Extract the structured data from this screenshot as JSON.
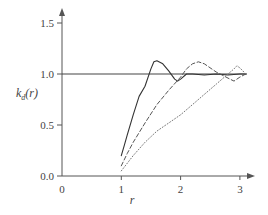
{
  "chart_data": {
    "type": "line",
    "title": "",
    "xlabel": "r",
    "ylabel": "k_d(r)",
    "ylabel_main": "k",
    "ylabel_sub": "d",
    "ylabel_arg": "(r)",
    "xlim": [
      0,
      3.2
    ],
    "ylim": [
      0,
      1.65
    ],
    "x_ticks": [
      0,
      1,
      2,
      3
    ],
    "x_tick_labels": [
      "0",
      "1",
      "2",
      "3"
    ],
    "y_ticks": [
      0.0,
      0.5,
      1.0,
      1.5
    ],
    "y_tick_labels": [
      "0.0",
      "0.5",
      "1.0",
      "1.5"
    ],
    "grid": false,
    "legend": null,
    "reference_line": {
      "y": 1.0,
      "x_from": 0,
      "x_to": 3.2,
      "style": "solid"
    },
    "series": [
      {
        "name": "solid",
        "style": "solid",
        "x": [
          1.0,
          1.05,
          1.1,
          1.2,
          1.3,
          1.4,
          1.5,
          1.55,
          1.6,
          1.7,
          1.8,
          1.9,
          1.95,
          2.0,
          2.1,
          2.2,
          2.4,
          2.6,
          2.8,
          3.0,
          3.1
        ],
        "y": [
          0.2,
          0.3,
          0.4,
          0.6,
          0.78,
          0.88,
          1.05,
          1.12,
          1.13,
          1.1,
          1.03,
          0.95,
          0.93,
          0.95,
          1.0,
          1.0,
          0.99,
          1.0,
          0.99,
          1.0,
          1.0
        ]
      },
      {
        "name": "dashed",
        "style": "dashed",
        "x": [
          1.0,
          1.1,
          1.2,
          1.4,
          1.6,
          1.8,
          2.0,
          2.1,
          2.2,
          2.3,
          2.4,
          2.6,
          2.8,
          2.9,
          3.0,
          3.1
        ],
        "y": [
          0.1,
          0.22,
          0.33,
          0.52,
          0.7,
          0.84,
          0.97,
          1.05,
          1.1,
          1.12,
          1.1,
          1.02,
          0.96,
          0.93,
          0.97,
          1.0
        ]
      },
      {
        "name": "dotted",
        "style": "dotted",
        "x": [
          1.0,
          1.2,
          1.4,
          1.6,
          1.8,
          2.0,
          2.2,
          2.4,
          2.6,
          2.8,
          2.9,
          2.95,
          3.0,
          3.1
        ],
        "y": [
          0.05,
          0.2,
          0.33,
          0.44,
          0.52,
          0.6,
          0.7,
          0.8,
          0.9,
          1.0,
          1.05,
          1.08,
          1.06,
          1.0
        ]
      }
    ]
  },
  "colors": {
    "axis": "#555555",
    "series_solid": "#333333",
    "series_dashed": "#555555",
    "series_dotted": "#777777",
    "reference": "#444444"
  }
}
